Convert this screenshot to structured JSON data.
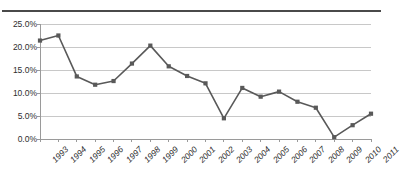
{
  "chart_data": {
    "type": "line",
    "title": "",
    "xlabel": "",
    "ylabel": "",
    "categories": [
      "1993",
      "1994",
      "1995",
      "1996",
      "1997",
      "1998",
      "1999",
      "2000",
      "2001",
      "2002",
      "2003",
      "2004",
      "2005",
      "2006",
      "2007",
      "2008",
      "2009",
      "2010",
      "2011"
    ],
    "values": [
      21.4,
      22.5,
      13.6,
      11.8,
      12.6,
      16.4,
      20.3,
      15.8,
      13.7,
      12.1,
      4.5,
      11.1,
      9.2,
      10.3,
      8.1,
      6.8,
      0.4,
      3.0,
      5.5
    ],
    "ytick_labels": [
      "25.0%",
      "20.0%",
      "15.0%",
      "10.0%",
      "5.0%",
      "0.0%"
    ],
    "ytick_values": [
      25,
      20,
      15,
      10,
      5,
      0
    ],
    "ylim": [
      0,
      25
    ],
    "grid": "horizontal",
    "legend": "none",
    "series_color": "#595959",
    "gridline_color": "#c8c8c8",
    "axis_color": "#9a9a9a",
    "marker": "square"
  },
  "figure": {
    "title_fragment": "",
    "top_rule_color": "#4a4a4a"
  }
}
